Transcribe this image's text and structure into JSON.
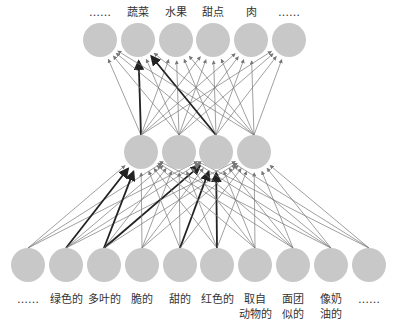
{
  "diagram": {
    "colors": {
      "node": "#c8c8c8",
      "edge": "#777777",
      "edge_strong": "#222222"
    },
    "output_labels": [
      "……",
      "蔬菜",
      "水果",
      "甜点",
      "肉",
      "……"
    ],
    "hidden_count": 4,
    "input_labels": [
      "……",
      "绿色的",
      "多叶的",
      "脆的",
      "甜的",
      "红色的",
      "取自\n动物的",
      "面团\n似的",
      "像奶\n油的",
      "……"
    ],
    "strong_edges_input_to_hidden": [
      [
        1,
        0
      ],
      [
        2,
        0
      ],
      [
        2,
        2
      ],
      [
        4,
        2
      ],
      [
        5,
        2
      ]
    ],
    "strong_edges_hidden_to_output": [
      [
        0,
        1
      ],
      [
        2,
        1
      ]
    ]
  }
}
